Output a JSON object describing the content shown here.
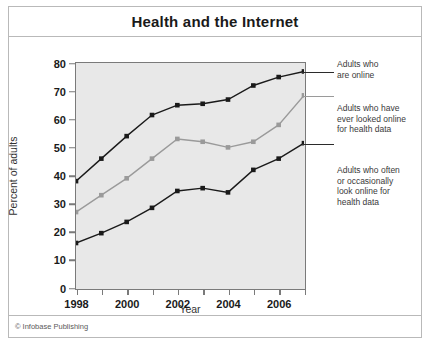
{
  "figure": {
    "title": "Health and the Internet",
    "copyright": "© Infobase Publishing"
  },
  "chart_data": {
    "type": "line",
    "title": "Health and the Internet",
    "xlabel": "Year",
    "ylabel": "Percent of adults",
    "x": [
      1998,
      1999,
      2000,
      2001,
      2002,
      2003,
      2004,
      2005,
      2006,
      2007
    ],
    "xlim": [
      1998,
      2007
    ],
    "ylim": [
      0,
      80
    ],
    "xticks": [
      1998,
      1999,
      2000,
      2001,
      2002,
      2003,
      2004,
      2005,
      2006,
      2007
    ],
    "xtick_labels": [
      "1998",
      "",
      "2000",
      "",
      "2002",
      "",
      "2004",
      "",
      "2006",
      ""
    ],
    "yticks": [
      0,
      10,
      20,
      30,
      40,
      50,
      60,
      70,
      80
    ],
    "ytick_labels": [
      "0",
      "10",
      "20",
      "30",
      "40",
      "50",
      "60",
      "70",
      "80"
    ],
    "grid": false,
    "legend_position": "right-outside",
    "plot_background": "#e8e8e8",
    "series": [
      {
        "name": "Adults who are online",
        "color": "#1a1a1a",
        "marker": "square",
        "values": [
          38,
          46,
          54,
          61.5,
          65,
          65.5,
          67,
          72,
          75,
          77
        ]
      },
      {
        "name": "Adults who have ever looked online for health data",
        "color": "#9a9a9a",
        "marker": "square",
        "values": [
          27,
          33,
          39,
          46,
          53,
          52,
          50,
          52,
          58,
          68.5
        ]
      },
      {
        "name": "Adults who often or occasionally look online for health data",
        "color": "#1a1a1a",
        "marker": "square",
        "values": [
          16,
          19.5,
          23.5,
          28.5,
          34.5,
          35.5,
          34,
          42,
          46,
          51.5
        ]
      }
    ]
  },
  "legend": {
    "entries": [
      {
        "label": "Adults who\nare online",
        "line1": "Adults who",
        "line2": "are online"
      },
      {
        "label": "Adults who have ever looked online for health data",
        "line1": "Adults who have",
        "line2": "ever looked online",
        "line3": "for health data"
      },
      {
        "label": "Adults who often or occasionally look online for health data",
        "line1": "Adults who often",
        "line2": "or occasionally",
        "line3": "look online for",
        "line4": "health data"
      }
    ]
  }
}
